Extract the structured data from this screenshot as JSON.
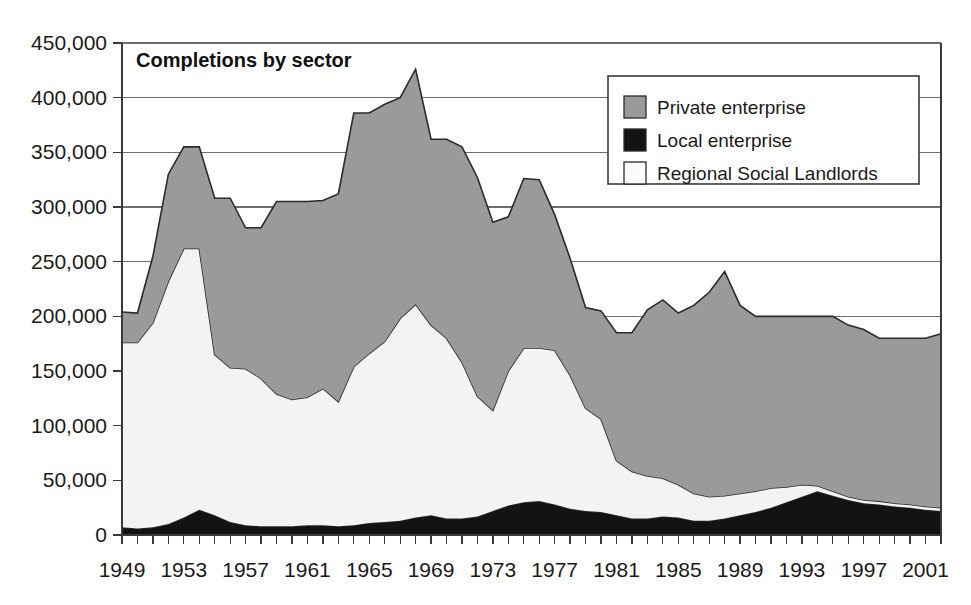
{
  "chart_data": {
    "type": "area",
    "stacked": true,
    "title": "Completions by sector",
    "xlabel": "",
    "ylabel": "",
    "ylim": [
      0,
      450000
    ],
    "ytick_labels": [
      "0",
      "50,000",
      "100,000",
      "150,000",
      "200,000",
      "250,000",
      "300,000",
      "350,000",
      "400,000",
      "450,000"
    ],
    "ytick_values": [
      0,
      50000,
      100000,
      150000,
      200000,
      250000,
      300000,
      350000,
      400000,
      450000
    ],
    "xtick_labels": [
      "1949",
      "1953",
      "1957",
      "1961",
      "1965",
      "1969",
      "1973",
      "1977",
      "1981",
      "1985",
      "1989",
      "1993",
      "1997",
      "2001"
    ],
    "xtick_values": [
      1949,
      1953,
      1957,
      1961,
      1965,
      1969,
      1973,
      1977,
      1981,
      1985,
      1989,
      1993,
      1997,
      2001
    ],
    "xlim": [
      1949,
      2002
    ],
    "grid": "horizontal",
    "legend_position": "top-right",
    "x": [
      1949,
      1950,
      1951,
      1952,
      1953,
      1954,
      1955,
      1956,
      1957,
      1958,
      1959,
      1960,
      1961,
      1962,
      1963,
      1964,
      1965,
      1966,
      1967,
      1968,
      1969,
      1970,
      1971,
      1972,
      1973,
      1974,
      1975,
      1976,
      1977,
      1978,
      1979,
      1980,
      1981,
      1982,
      1983,
      1984,
      1985,
      1986,
      1987,
      1988,
      1989,
      1990,
      1991,
      1992,
      1993,
      1994,
      1995,
      1996,
      1997,
      1998,
      1999,
      2000,
      2001,
      2002
    ],
    "series": [
      {
        "name": "Local enterprise",
        "color": "#131313",
        "order": 0,
        "values": [
          7000,
          6000,
          7000,
          10000,
          16000,
          23000,
          18000,
          12000,
          9000,
          8000,
          8000,
          8000,
          9000,
          9000,
          8000,
          9000,
          11000,
          12000,
          13000,
          16000,
          18000,
          15000,
          15000,
          17000,
          22000,
          27000,
          30000,
          31000,
          28000,
          24000,
          22000,
          21000,
          18000,
          15000,
          15000,
          17000,
          16000,
          13000,
          13000,
          15000,
          18000,
          21000,
          25000,
          30000,
          35000,
          40000,
          36000,
          32000,
          29000,
          28000,
          26000,
          25000,
          23000,
          22000
        ]
      },
      {
        "name": "Regional Social Landlords",
        "color": "#f3f3f3",
        "order": 1,
        "values": [
          169000,
          170000,
          187000,
          222000,
          246000,
          239000,
          147000,
          141000,
          143000,
          135000,
          121000,
          116000,
          117000,
          125000,
          114000,
          145000,
          155000,
          165000,
          185000,
          195000,
          174000,
          165000,
          143000,
          110000,
          92000,
          123000,
          141000,
          140000,
          141000,
          122000,
          94000,
          85000,
          50000,
          43000,
          39000,
          35000,
          30000,
          25000,
          22000,
          21000,
          20000,
          19000,
          18000,
          14000,
          11000,
          5000,
          4000,
          3000,
          3000,
          3000,
          3000,
          3000,
          3000,
          3000
        ]
      },
      {
        "name": "Private enterprise",
        "color": "#9a9a9a",
        "order": 2,
        "values": [
          28000,
          27000,
          61000,
          98000,
          93000,
          93000,
          143000,
          155000,
          129000,
          138000,
          176000,
          181000,
          179000,
          172000,
          190000,
          232000,
          220000,
          217000,
          202000,
          215000,
          170000,
          182000,
          197000,
          200000,
          172000,
          141000,
          155000,
          154000,
          124000,
          107000,
          92000,
          99000,
          117000,
          127000,
          152000,
          163000,
          157000,
          172000,
          187000,
          205000,
          172000,
          160000,
          157000,
          156000,
          154000,
          155000,
          160000,
          157000,
          156000,
          149000,
          151000,
          152000,
          154000,
          159000
        ]
      }
    ],
    "legend": [
      {
        "label": "Private enterprise",
        "swatch": "#9a9a9a"
      },
      {
        "label": "Local enterprise",
        "swatch": "#131313"
      },
      {
        "label": "Regional Social Landlords",
        "swatch": "#fbfbfb"
      }
    ]
  }
}
